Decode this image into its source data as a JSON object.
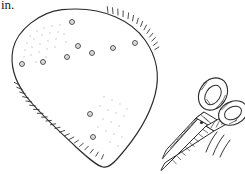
{
  "page": {
    "width": 245,
    "height": 174,
    "background_color": "#ffffff",
    "ink_color": "#2b2b2b",
    "faint_ink_color": "#b9b9b9",
    "style": "black-and-white pen line drawing / instructional craft illustration"
  },
  "caption": {
    "fragment_text": "in.",
    "note": "truncated text fragment at top-left edge of the crop"
  },
  "figure": {
    "objects": [
      {
        "name": "blob-shape",
        "description": "large teardrop / egg-shaped outline, wide rounded top, tapering to a rounded point at bottom",
        "outline_color": "#2b2b2b",
        "fill_color": "#ffffff",
        "bounding_box": {
          "x": 10,
          "y": 8,
          "width": 150,
          "height": 160
        }
      },
      {
        "name": "fringe-hatching",
        "description": "short tick marks along the upper-right and lower-left portions of the blob outline"
      },
      {
        "name": "stipple-texture",
        "description": "faint scattered dots inside the blob, denser at upper-left and lower-middle"
      },
      {
        "name": "scissors",
        "description": "open pair of scissors angled down-left, two hatched oval finger handles at upper right, crossed hatched blades to lower left, pivot dot at center",
        "bounding_box": {
          "x": 158,
          "y": 68,
          "width": 84,
          "height": 98
        }
      },
      {
        "name": "motion-lines",
        "description": "three short curved speed lines to the lower-right of the scissors"
      }
    ],
    "small_circles": {
      "label": "scattered small ring markers inside blob",
      "count": 12,
      "radius": 2.4,
      "points": [
        {
          "cx": 72,
          "cy": 22
        },
        {
          "cx": 22,
          "cy": 64
        },
        {
          "cx": 43,
          "cy": 62
        },
        {
          "cx": 67,
          "cy": 57
        },
        {
          "cx": 78,
          "cy": 46
        },
        {
          "cx": 92,
          "cy": 53
        },
        {
          "cx": 113,
          "cy": 48
        },
        {
          "cx": 135,
          "cy": 43
        },
        {
          "cx": 90,
          "cy": 114
        },
        {
          "cx": 93,
          "cy": 137
        },
        {
          "cx": 57,
          "cy": 61
        },
        {
          "cx": 104,
          "cy": 50
        }
      ]
    }
  }
}
